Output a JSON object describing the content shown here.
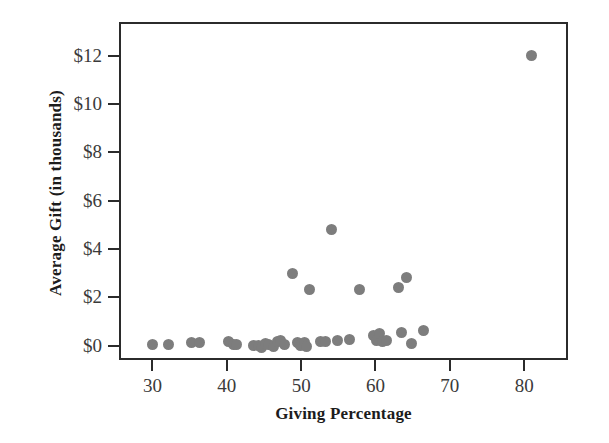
{
  "chart_data": {
    "type": "scatter",
    "title": "",
    "xlabel": "Giving Percentage",
    "ylabel": "Average Gift (in thousands)",
    "xlim": [
      25.5,
      85.9
    ],
    "ylim": [
      -0.6,
      13.4
    ],
    "xticks": [
      30,
      40,
      50,
      60,
      70,
      80
    ],
    "xticklabels": [
      "30",
      "40",
      "50",
      "60",
      "70",
      "80"
    ],
    "yticks": [
      0,
      2,
      4,
      6,
      8,
      10,
      12
    ],
    "yticklabels": [
      "$0",
      "$2",
      "$4",
      "$6",
      "$8",
      "$10",
      "$12"
    ],
    "grid": false,
    "legend": null,
    "marker_color": "#7d7d7d",
    "frame_color": "#2b2b2b",
    "points": [
      {
        "x": 29.8,
        "y": 0.12
      },
      {
        "x": 31.9,
        "y": 0.12
      },
      {
        "x": 35.0,
        "y": 0.2
      },
      {
        "x": 36.1,
        "y": 0.22
      },
      {
        "x": 39.9,
        "y": 0.25
      },
      {
        "x": 40.6,
        "y": 0.14
      },
      {
        "x": 41.1,
        "y": 0.12
      },
      {
        "x": 43.3,
        "y": 0.1
      },
      {
        "x": 44.0,
        "y": 0.1
      },
      {
        "x": 44.4,
        "y": 0.02
      },
      {
        "x": 44.9,
        "y": 0.18
      },
      {
        "x": 45.4,
        "y": 0.12
      },
      {
        "x": 46.0,
        "y": 0.06
      },
      {
        "x": 46.6,
        "y": 0.26
      },
      {
        "x": 47.0,
        "y": 0.3
      },
      {
        "x": 47.5,
        "y": 0.13
      },
      {
        "x": 48.6,
        "y": 3.05
      },
      {
        "x": 49.3,
        "y": 0.2
      },
      {
        "x": 49.7,
        "y": 0.1
      },
      {
        "x": 50.2,
        "y": 0.22
      },
      {
        "x": 50.4,
        "y": 0.04
      },
      {
        "x": 50.8,
        "y": 2.4
      },
      {
        "x": 52.3,
        "y": 0.24
      },
      {
        "x": 53.0,
        "y": 0.26
      },
      {
        "x": 53.8,
        "y": 4.9
      },
      {
        "x": 54.6,
        "y": 0.3
      },
      {
        "x": 56.3,
        "y": 0.35
      },
      {
        "x": 57.6,
        "y": 2.42
      },
      {
        "x": 59.5,
        "y": 0.48
      },
      {
        "x": 59.9,
        "y": 0.3
      },
      {
        "x": 60.3,
        "y": 0.6
      },
      {
        "x": 60.7,
        "y": 0.26
      },
      {
        "x": 61.2,
        "y": 0.28
      },
      {
        "x": 62.8,
        "y": 2.48
      },
      {
        "x": 63.2,
        "y": 0.62
      },
      {
        "x": 63.9,
        "y": 2.88
      },
      {
        "x": 64.6,
        "y": 0.15
      },
      {
        "x": 66.2,
        "y": 0.7
      },
      {
        "x": 80.7,
        "y": 12.1
      }
    ]
  },
  "axes": {
    "x_title": "Giving Percentage",
    "y_title": "Average Gift (in thousands)"
  }
}
